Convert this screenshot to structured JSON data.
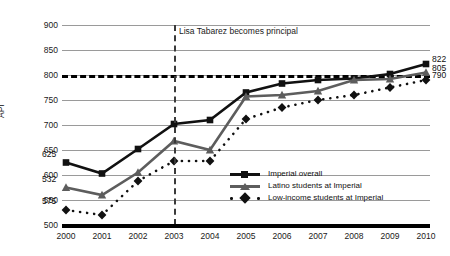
{
  "chart_data": {
    "type": "line",
    "title": "",
    "xlabel": "",
    "ylabel": "API",
    "categories": [
      "2000",
      "2001",
      "2002",
      "2003",
      "2004",
      "2005",
      "2006",
      "2007",
      "2008",
      "2009",
      "2010"
    ],
    "ylim": [
      500,
      900
    ],
    "yticks": [
      500,
      550,
      600,
      650,
      700,
      750,
      800,
      850,
      900
    ],
    "grid": true,
    "legend_position": "inside-bottom-right",
    "series": [
      {
        "name": "Imperial overall",
        "marker": "square",
        "color": "#111111",
        "style": "solid",
        "values": [
          625,
          603,
          652,
          702,
          710,
          765,
          783,
          790,
          793,
          802,
          822
        ]
      },
      {
        "name": "Latino students at Imperial",
        "marker": "triangle",
        "color": "#5d5d5d",
        "style": "solid",
        "values": [
          575,
          560,
          605,
          668,
          650,
          757,
          760,
          768,
          790,
          792,
          805
        ]
      },
      {
        "name": "Low-income students at Imperial",
        "marker": "diamond",
        "color": "#111111",
        "style": "dotted",
        "values": [
          530,
          520,
          588,
          628,
          628,
          712,
          735,
          750,
          760,
          775,
          790
        ]
      }
    ],
    "point_labels": [
      {
        "text": "625",
        "series": "Imperial overall",
        "category": "2000",
        "side": "left"
      },
      {
        "text": "532",
        "series": "Latino students at Imperial",
        "category": "2000",
        "side": "left"
      },
      {
        "text": "575",
        "series": "Low-income students at Imperial",
        "category": "2000",
        "side": "left"
      },
      {
        "text": "822",
        "series": "Imperial overall",
        "category": "2010",
        "side": "right"
      },
      {
        "text": "805",
        "series": "Latino students at Imperial",
        "category": "2010",
        "side": "right"
      },
      {
        "text": "790",
        "series": "Low-income students at Imperial",
        "category": "2010",
        "side": "right"
      }
    ],
    "reference_lines": [
      {
        "orientation": "horizontal",
        "value": 800,
        "style": "dashed",
        "color": "#000000"
      },
      {
        "orientation": "vertical",
        "value": "2003",
        "style": "dashed",
        "color": "#3a3a3a",
        "annotation": "Lisa Tabarez becomes principal"
      }
    ]
  }
}
